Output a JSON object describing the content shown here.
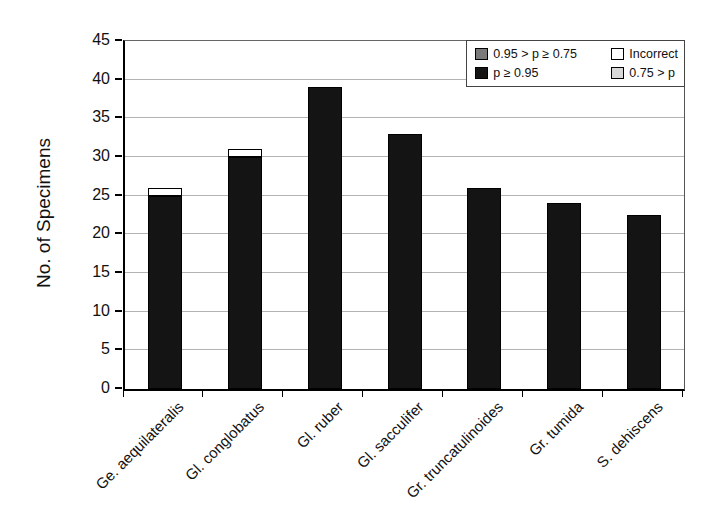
{
  "chart_data": {
    "type": "bar",
    "stacked": true,
    "title": "",
    "xlabel": "",
    "ylabel": "No. of Specimens",
    "ylim": [
      0,
      45
    ],
    "ytick_step": 5,
    "grid": "horizontal",
    "categories": [
      "Ge. aequilateralis",
      "Gl. conglobatus",
      "Gl. ruber",
      "Gl. sacculifer",
      "Gr. truncatulinoides",
      "Gr. tumida",
      "S. dehiscens"
    ],
    "series": [
      {
        "name": "p ≥ 0.95",
        "color": "#141414",
        "values": [
          25,
          30,
          39,
          33,
          26,
          24,
          22.5
        ]
      },
      {
        "name": "0.95 > p ≥ 0.75",
        "color": "#7a7a7a",
        "values": [
          0,
          0,
          0,
          0,
          0,
          0,
          0
        ]
      },
      {
        "name": "0.75 > p",
        "color": "#d8d8d8",
        "values": [
          0,
          0,
          0,
          0,
          0,
          0,
          0
        ]
      },
      {
        "name": "Incorrect",
        "color": "#ffffff",
        "values": [
          1,
          1,
          0,
          0,
          0,
          0,
          0
        ]
      }
    ],
    "legend": {
      "position": "top-right",
      "items": [
        {
          "label": "0.95 > p ≥ 0.75",
          "color": "#7a7a7a"
        },
        {
          "label": "Incorrect",
          "color": "#ffffff"
        },
        {
          "label": "p ≥ 0.95",
          "color": "#141414"
        },
        {
          "label": "0.75 > p",
          "color": "#d8d8d8"
        }
      ]
    }
  }
}
